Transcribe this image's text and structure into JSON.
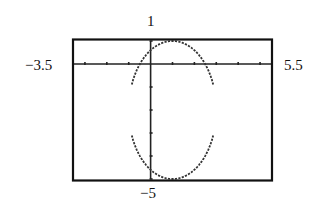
{
  "chart_data": {
    "type": "line",
    "title": "",
    "equation": "(x-1)^2/4 + (y+2)^2/9 = 1",
    "xlabel": "",
    "ylabel": "",
    "xlim": [
      -3.5,
      5.5
    ],
    "ylim": [
      -5,
      1
    ],
    "xscale_tick": 1,
    "yscale_tick": 1,
    "grid": false,
    "window_labels": {
      "xmin": "−3.5",
      "xmax": "5.5",
      "ymax": "1",
      "ymin": "−5"
    },
    "series": [
      {
        "name": "ellipse",
        "center": [
          1,
          -2
        ],
        "semi_axis_x": 2,
        "semi_axis_y": 3,
        "style": "dashed-pixel"
      }
    ]
  },
  "colors": {
    "frame": "#111111",
    "axis": "#222222",
    "curve": "#333333",
    "background": "#ffffff"
  }
}
